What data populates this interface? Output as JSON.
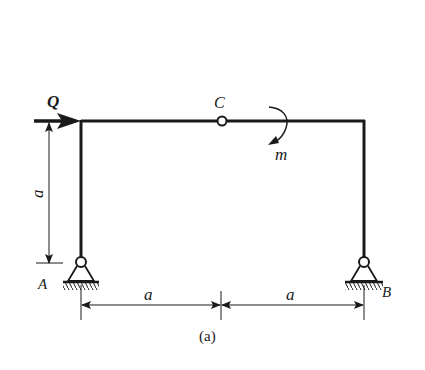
{
  "figure": {
    "caption": "(a)",
    "type": "plane frame with hinge",
    "labels": {
      "force": "Q",
      "hinge": "C",
      "moment": "m",
      "support_left": "A",
      "support_right": "B"
    },
    "dimensions": {
      "column_height": "a",
      "span_left": "a",
      "span_right": "a"
    },
    "colors": {
      "ink": "#1a1a1a",
      "background": "#ffffff"
    }
  }
}
